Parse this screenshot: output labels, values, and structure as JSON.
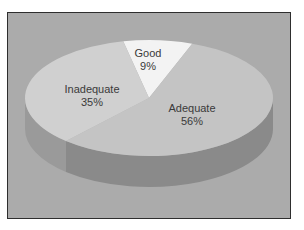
{
  "chart_data": {
    "type": "pie",
    "title": "",
    "style": "3d",
    "slices": [
      {
        "name": "Good",
        "label": "Good",
        "value": 9,
        "value_label": "9%",
        "color": "#f3f3f3",
        "side_color": "#d8d8d8"
      },
      {
        "name": "Adequate",
        "label": "Adequate",
        "value": 56,
        "value_label": "56%",
        "color": "#c4c4c4",
        "side_color": "#8a8a8a"
      },
      {
        "name": "Inadequate",
        "label": "Inadequate",
        "value": 35,
        "value_label": "35%",
        "color": "#d0d0d0",
        "side_color": "#9a9a9a"
      }
    ],
    "background_color": "#ababab"
  }
}
